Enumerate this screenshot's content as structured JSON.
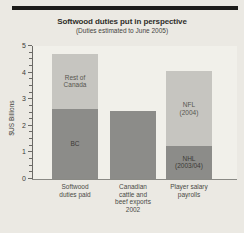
{
  "rules": {
    "top": true,
    "bottom": true
  },
  "chart_data": {
    "type": "bar",
    "stacked": true,
    "title": "Softwood duties put in perspective",
    "subtitle": "(Duties estimated to June 2005)",
    "ylabel": "$US Billions",
    "ylim": [
      0,
      5
    ],
    "yticks": [
      0,
      1,
      2,
      3,
      4,
      5
    ],
    "minor_tick_interval": 0.25,
    "grid": false,
    "legend": "labels-inside-bars",
    "categories": [
      "Softwood\nduties paid",
      "Canadian\ncattle and\nbeef exports\n2002",
      "Player salary\npayrolls"
    ],
    "colors": {
      "dark": "#8c8c89",
      "light": "#c6c5c0",
      "background": "#ebe9e3",
      "plot_background": "#f1f0ea"
    },
    "bars": [
      {
        "category": "Softwood duties paid",
        "total": 4.7,
        "segments": [
          {
            "label": "BC",
            "value": 2.65,
            "color": "dark"
          },
          {
            "label": "Rest of\nCanada",
            "value": 2.05,
            "color": "light"
          }
        ]
      },
      {
        "category": "Canadian cattle and beef exports 2002",
        "total": 2.55,
        "segments": [
          {
            "label": "",
            "value": 2.55,
            "color": "dark"
          }
        ]
      },
      {
        "category": "Player salary payrolls",
        "total": 4.05,
        "segments": [
          {
            "label": "NHL\n(2003/04)",
            "value": 1.25,
            "color": "dark"
          },
          {
            "label": "NFL\n(2004)",
            "value": 2.8,
            "color": "light"
          }
        ]
      }
    ]
  }
}
